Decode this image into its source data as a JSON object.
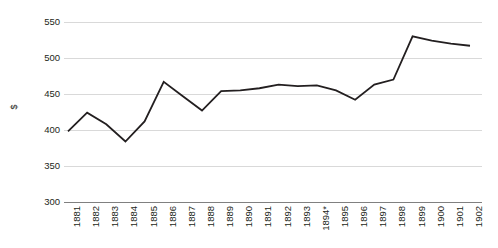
{
  "chart_data": {
    "type": "line",
    "title": "",
    "subtitle": "",
    "xlabel": "",
    "ylabel": "$",
    "categories": [
      "1881",
      "1882",
      "1883",
      "1884",
      "1885",
      "1886",
      "1887",
      "1888",
      "1889",
      "1890",
      "1891",
      "1892",
      "1893",
      "1894*",
      "1895",
      "1896",
      "1897",
      "1898",
      "1899",
      "1900",
      "1901",
      "1902"
    ],
    "values": [
      398,
      424,
      408,
      384,
      412,
      467,
      447,
      427,
      454,
      455,
      458,
      463,
      461,
      462,
      455,
      442,
      463,
      470,
      530,
      524,
      520,
      517
    ],
    "series": [
      {
        "name": "$",
        "values": [
          398,
          424,
          408,
          384,
          412,
          467,
          447,
          427,
          454,
          455,
          458,
          463,
          461,
          462,
          455,
          442,
          463,
          470,
          530,
          524,
          520,
          517
        ]
      }
    ],
    "ylim": [
      300,
      550
    ],
    "yticks": [
      300,
      350,
      400,
      450,
      500,
      550
    ],
    "ytick_labels": [
      "300",
      "350",
      "400",
      "450",
      "500",
      "550"
    ],
    "grid": true,
    "legend": false,
    "legend_position": "none",
    "line_color": "#231f20",
    "grid_color": "#d9d9d9",
    "axis_color": "#808080",
    "background_color": "#ffffff",
    "annotations": [
      {
        "text": "*",
        "attached_to": "1894",
        "meaning": "asterisk marker on 1894 tick label"
      }
    ]
  }
}
